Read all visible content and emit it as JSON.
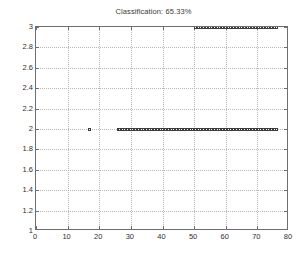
{
  "figure": {
    "title": "Classification: 65.33%",
    "background_color": "#ffffff",
    "axis_color": "#6e6e6e",
    "grid_color": "#b8b8b8",
    "marker_color": "#3c3c3c",
    "text_color": "#2f2f2f"
  },
  "chart_data": {
    "type": "scatter",
    "title": "Classification: 65.33%",
    "xlabel": "",
    "ylabel": "",
    "xlim": [
      0,
      80
    ],
    "ylim": [
      1,
      3
    ],
    "grid": true,
    "legend": "none",
    "marker": "square",
    "xticks": [
      0,
      10,
      20,
      30,
      40,
      50,
      60,
      70,
      80
    ],
    "yticks": [
      1,
      1.2,
      1.4,
      1.6,
      1.8,
      2,
      2.2,
      2.4,
      2.6,
      2.8,
      3
    ],
    "xtick_labels": [
      "0",
      "10",
      "20",
      "30",
      "40",
      "50",
      "60",
      "70",
      "80"
    ],
    "ytick_labels": [
      "1",
      "1.2",
      "1.4",
      "1.6",
      "1.8",
      "2",
      "2.2",
      "2.4",
      "2.6",
      "2.8",
      "3"
    ],
    "series": [
      {
        "name": "class-1",
        "y": 1,
        "x": [
          0.5,
          1,
          1.5,
          2,
          2.5,
          3,
          3.5,
          4,
          4.5,
          5,
          5.5,
          6,
          6.5,
          7,
          7.5,
          8,
          8.5,
          9,
          9.5,
          10,
          10.5,
          11,
          11.5,
          12,
          12.5,
          13,
          13.5,
          14,
          14.5,
          15,
          15.5,
          16,
          16.5,
          17,
          17.5,
          18,
          18.5,
          19,
          19.5,
          20,
          20.5,
          21,
          21.5,
          22,
          22.5,
          23,
          23.5,
          24,
          24.5,
          25,
          25.5,
          26
        ]
      },
      {
        "name": "class-2",
        "y": 2,
        "x": [
          17,
          26,
          26.5,
          27,
          27.5,
          28,
          28.5,
          29,
          29.5,
          30,
          30.5,
          31,
          31.5,
          32,
          32.5,
          33,
          33.5,
          34,
          34.5,
          35,
          35.5,
          36,
          36.5,
          37,
          37.5,
          38,
          38.5,
          39,
          39.5,
          40,
          40.5,
          41,
          41.5,
          42,
          42.5,
          43,
          43.5,
          44,
          44.5,
          45,
          45.5,
          46,
          46.5,
          47,
          47.5,
          48,
          48.5,
          49,
          49.5,
          50,
          50.5,
          51,
          51.5,
          52,
          52.5,
          53,
          53.5,
          54,
          54.5,
          55,
          55.5,
          56,
          56.5,
          57,
          57.5,
          58,
          58.5,
          59,
          59.5,
          60,
          60.5,
          61,
          61.5,
          62,
          62.5,
          63,
          63.5,
          64,
          64.5,
          65,
          65.5,
          66,
          66.5,
          67,
          67.5,
          68,
          68.5,
          69,
          69.5,
          70,
          70.5,
          71,
          71.5,
          72,
          72.5,
          73,
          73.5,
          74,
          74.5,
          75,
          75.5,
          76
        ]
      },
      {
        "name": "class-3",
        "y": 3,
        "x": [
          50.5,
          51,
          51.5,
          52,
          52.5,
          53,
          53.5,
          54,
          54.5,
          55,
          55.5,
          56,
          56.5,
          57,
          57.5,
          58,
          58.5,
          59,
          59.5,
          60,
          60.5,
          61,
          61.5,
          62,
          62.5,
          63,
          63.5,
          64,
          64.5,
          65,
          65.5,
          66,
          66.5,
          67,
          67.5,
          68,
          68.5,
          69,
          69.5,
          70,
          70.5,
          71,
          71.5,
          72,
          72.5,
          73,
          73.5,
          74,
          74.5,
          75,
          75.5,
          76
        ]
      }
    ]
  }
}
